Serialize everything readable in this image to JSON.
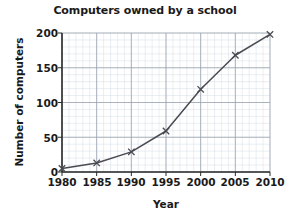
{
  "chart_data": {
    "type": "line",
    "title": "Computers owned by a school",
    "xlabel": "Year",
    "ylabel": "Number of computers",
    "x": [
      1980,
      1985,
      1990,
      1995,
      2000,
      2005,
      2010
    ],
    "values": [
      5,
      13,
      29,
      59,
      119,
      168,
      198
    ],
    "series": [
      {
        "name": "Computers owned",
        "values": [
          5,
          13,
          29,
          59,
          119,
          168,
          198
        ]
      }
    ],
    "xlim": [
      1980,
      2010
    ],
    "ylim": [
      0,
      200
    ],
    "x_tick_labels": [
      "1980",
      "1985",
      "1990",
      "1995",
      "2000",
      "2005",
      "2010"
    ],
    "y_tick_labels": [
      "0",
      "50",
      "100",
      "150",
      "200"
    ],
    "y_ticks": [
      0,
      50,
      100,
      150,
      200
    ],
    "x_major_step": 5,
    "x_minor_step": 1,
    "y_major_step": 50,
    "y_minor_step": 10,
    "grid": true,
    "minor_grid": true,
    "legend": "none",
    "marker": "x",
    "line_color": "#4a4a52",
    "major_grid_color": "#9aa3b0",
    "minor_grid_color": "#d6dce5",
    "axis_color": "#2b2b2b",
    "background": "#ffffff"
  }
}
